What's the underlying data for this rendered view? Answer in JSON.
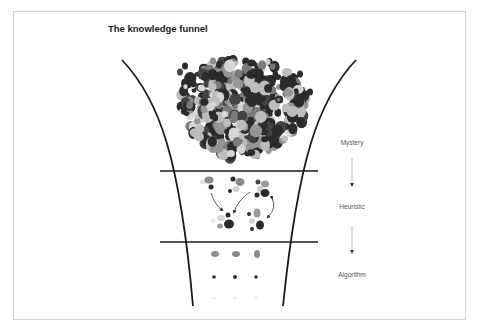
{
  "title": "The knowledge funnel",
  "stages": [
    {
      "label": "Mystery",
      "x": 352,
      "y": 139
    },
    {
      "label": "Heuristic",
      "x": 352,
      "y": 203
    },
    {
      "label": "Algorithm",
      "x": 352,
      "y": 271
    }
  ],
  "colors": {
    "funnel_line": "#1a1a1a",
    "dot_dark": "#2b2b2b",
    "dot_mid": "#7a7a7a",
    "dot_light": "#bdbdbd",
    "dot_faint": "#e2e2e2",
    "label": "#555555",
    "frame": "#d4d4d4"
  },
  "sections": [
    "mystery-cluster",
    "heuristic-groups",
    "algorithm-rows"
  ]
}
